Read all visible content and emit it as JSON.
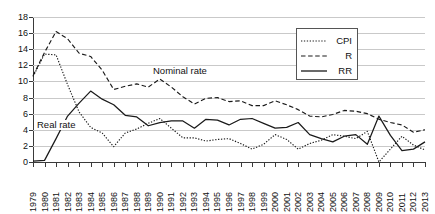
{
  "chart_data": {
    "type": "line",
    "title": "",
    "xlabel": "",
    "ylabel": "",
    "ylim": [
      0,
      18
    ],
    "ytick_step": 2,
    "yticks": [
      18,
      16,
      14,
      12,
      10,
      8,
      6,
      4,
      2,
      0
    ],
    "grid": true,
    "legend_position": "top-right",
    "x": [
      1979,
      1980,
      1981,
      1982,
      1983,
      1984,
      1985,
      1986,
      1987,
      1988,
      1989,
      1990,
      1991,
      1992,
      1993,
      1994,
      1995,
      1996,
      1997,
      1998,
      1999,
      2000,
      2001,
      2002,
      2003,
      2004,
      2005,
      2006,
      2007,
      2008,
      2009,
      2010,
      2011,
      2012,
      2013
    ],
    "categories": [
      "1979",
      "1980",
      "1981",
      "1982",
      "1983",
      "1984",
      "1985",
      "1986",
      "1987",
      "1988",
      "1989",
      "1990",
      "1991",
      "1992",
      "1993",
      "1994",
      "1995",
      "1996",
      "1997",
      "1998",
      "1999",
      "2000",
      "2001",
      "2002",
      "2003",
      "2004",
      "2005",
      "2006",
      "2007",
      "2008",
      "2009",
      "2010",
      "2011",
      "2012",
      "2013"
    ],
    "series": [
      {
        "name": "CPI",
        "style": "dotted",
        "values": [
          10.6,
          13.4,
          13.3,
          9.6,
          6.2,
          4.3,
          3.6,
          1.9,
          3.6,
          4.1,
          4.8,
          5.4,
          4.2,
          3.0,
          3.0,
          2.6,
          2.8,
          2.9,
          2.3,
          1.6,
          2.2,
          3.4,
          2.8,
          1.6,
          2.3,
          2.7,
          3.4,
          3.2,
          2.9,
          3.8,
          -0.4,
          1.6,
          3.2,
          2.1,
          1.5
        ]
      },
      {
        "name": "R",
        "style": "dashed",
        "values": [
          10.7,
          13.6,
          16.2,
          15.3,
          13.5,
          13.1,
          11.4,
          9.0,
          9.4,
          9.7,
          9.3,
          10.3,
          9.3,
          8.1,
          7.2,
          7.9,
          8.0,
          7.5,
          7.6,
          7.0,
          7.0,
          7.6,
          7.1,
          6.5,
          5.7,
          5.6,
          5.9,
          6.4,
          6.3,
          6.0,
          5.3,
          4.9,
          4.6,
          3.7,
          4.0
        ]
      },
      {
        "name": "RR",
        "style": "solid",
        "values": [
          0.1,
          0.2,
          2.9,
          5.7,
          7.3,
          8.8,
          7.8,
          7.1,
          5.8,
          5.6,
          4.5,
          4.9,
          5.1,
          5.1,
          4.2,
          5.3,
          5.2,
          4.6,
          5.3,
          5.4,
          4.8,
          4.2,
          4.3,
          4.9,
          3.4,
          2.9,
          2.5,
          3.2,
          3.4,
          2.2,
          5.7,
          3.3,
          1.4,
          1.6,
          2.5
        ]
      }
    ],
    "annotations": [
      {
        "text": "Real rate",
        "at_year": 1983,
        "at_value": 6.2
      },
      {
        "text": "Nominal rate",
        "at_year": 1988,
        "at_value": 11.5
      }
    ]
  },
  "legend": {
    "entries": [
      {
        "label": "CPI",
        "style": "dotted"
      },
      {
        "label": "R",
        "style": "dashed"
      },
      {
        "label": "RR",
        "style": "solid"
      }
    ]
  }
}
